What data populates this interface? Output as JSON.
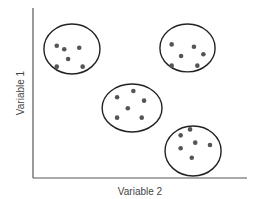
{
  "chart_data": {
    "type": "scatter",
    "title": "",
    "xlabel": "Variable 2",
    "ylabel": "Variable 1",
    "xlim": [
      0,
      100
    ],
    "ylim": [
      0,
      100
    ],
    "grid": false,
    "ticks": false,
    "legend": "none",
    "clusters": [
      {
        "name": "cluster-top-left",
        "ellipse": {
          "cx": 18.2,
          "cy": 75.9,
          "rx": 13.1,
          "ry": 14.7
        },
        "points": [
          {
            "x": 11.1,
            "y": 77.8
          },
          {
            "x": 14.6,
            "y": 75.7
          },
          {
            "x": 21.6,
            "y": 76.6
          },
          {
            "x": 16.4,
            "y": 70.0
          },
          {
            "x": 11.1,
            "y": 65.5
          },
          {
            "x": 23.2,
            "y": 65.5
          }
        ]
      },
      {
        "name": "cluster-top-right",
        "ellipse": {
          "cx": 72.2,
          "cy": 76.5,
          "rx": 12.9,
          "ry": 14.1
        },
        "points": [
          {
            "x": 64.8,
            "y": 78.6
          },
          {
            "x": 75.2,
            "y": 77.2
          },
          {
            "x": 79.6,
            "y": 72.8
          },
          {
            "x": 69.2,
            "y": 71.8
          },
          {
            "x": 64.8,
            "y": 66.1
          },
          {
            "x": 76.8,
            "y": 66.1
          }
        ]
      },
      {
        "name": "cluster-middle",
        "ellipse": {
          "cx": 46.3,
          "cy": 41.2,
          "rx": 14.0,
          "ry": 14.1
        },
        "points": [
          {
            "x": 39.3,
            "y": 47.5
          },
          {
            "x": 46.9,
            "y": 51.2
          },
          {
            "x": 51.9,
            "y": 45.5
          },
          {
            "x": 44.3,
            "y": 41.0
          },
          {
            "x": 39.3,
            "y": 35.5
          },
          {
            "x": 50.8,
            "y": 35.5
          }
        ]
      },
      {
        "name": "cluster-bottom-right",
        "ellipse": {
          "cx": 74.8,
          "cy": 15.9,
          "rx": 13.1,
          "ry": 14.7
        },
        "points": [
          {
            "x": 73.4,
            "y": 28.6
          },
          {
            "x": 69.0,
            "y": 25.1
          },
          {
            "x": 75.8,
            "y": 20.8
          },
          {
            "x": 82.7,
            "y": 19.4
          },
          {
            "x": 69.0,
            "y": 17.5
          },
          {
            "x": 74.2,
            "y": 11.9
          }
        ]
      }
    ]
  }
}
